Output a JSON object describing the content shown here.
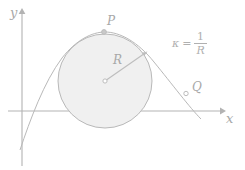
{
  "figure": {
    "background_color": "#ffffff",
    "axes": {
      "x_label": "x",
      "y_label": "y",
      "axis_color": "#b3b3b3",
      "x_axis": {
        "y": 111,
        "x_start": 8,
        "x_end": 222
      },
      "y_axis": {
        "x": 22,
        "y_start": 10,
        "y_end": 166
      }
    },
    "circle": {
      "name": "osculating-circle",
      "center_x": 105,
      "center_y": 81,
      "radius": 47,
      "fill_color": "#f0f0f0",
      "stroke_color": "#b9b9b9"
    },
    "curve": {
      "name": "parabola",
      "stroke_color": "#b9b9b9",
      "path": "M 20,150 C 30,120 44,82 62,58 C 76,40 92,32 105,32 C 120,32 138,42 154,62 C 172,84 190,108 201,119"
    },
    "radius_arrow": {
      "name": "radius-arrow",
      "from_x": 105,
      "from_y": 81,
      "to_x": 147,
      "to_y": 52,
      "stroke_color": "#b9b9b9",
      "label": "R"
    },
    "points": [
      {
        "id": "P",
        "label": "P",
        "x": 104,
        "y": 32,
        "style": "filled",
        "color": "#bdbdbd"
      },
      {
        "id": "Q",
        "label": "Q",
        "x": 186,
        "y": 93,
        "style": "open",
        "color": "#bdbdbd"
      },
      {
        "id": "center",
        "label": "",
        "x": 105,
        "y": 81,
        "style": "open",
        "color": "#bdbdbd"
      }
    ],
    "annotation": {
      "name": "curvature-formula",
      "kappa_symbol": "κ",
      "equals": "=",
      "numerator": "1",
      "denominator": "R",
      "text_color": "#b0b0b0"
    }
  }
}
